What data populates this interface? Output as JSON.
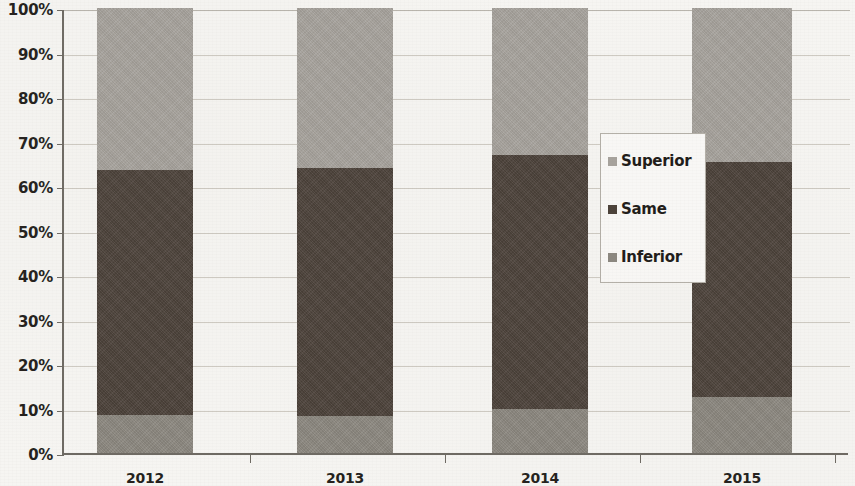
{
  "chart_data": {
    "type": "bar",
    "subtype": "stacked-100-percent",
    "title": "",
    "xlabel": "",
    "ylabel": "",
    "categories": [
      "2012",
      "2013",
      "2014",
      "2015"
    ],
    "series": [
      {
        "name": "Inferior",
        "color": "#8c8880",
        "values": [
          8.5,
          8.3,
          10.0,
          12.5
        ]
      },
      {
        "name": "Same",
        "color": "#4a4038",
        "values": [
          55.0,
          55.7,
          57.0,
          53.0
        ]
      },
      {
        "name": "Superior",
        "color": "#a8a49e",
        "values": [
          36.5,
          36.0,
          33.0,
          34.5
        ]
      }
    ],
    "stack_order_bottom_to_top": [
      "Inferior",
      "Same",
      "Superior"
    ],
    "ylim": [
      0,
      100
    ],
    "ytick_labels": [
      "0%",
      "10%",
      "20%",
      "30%",
      "40%",
      "50%",
      "60%",
      "70%",
      "80%",
      "90%",
      "100%"
    ],
    "ytick_values": [
      0,
      10,
      20,
      30,
      40,
      50,
      60,
      70,
      80,
      90,
      100
    ],
    "grid": true,
    "legend_position": "center-right",
    "legend_entries": [
      {
        "label": "Superior",
        "color": "#a8a49e"
      },
      {
        "label": "Same",
        "color": "#4a4038"
      },
      {
        "label": "Inferior",
        "color": "#8c8880"
      }
    ]
  },
  "bar_layout": {
    "bars": [
      {
        "x": 33,
        "width": 96
      },
      {
        "x": 233,
        "width": 96
      },
      {
        "x": 428,
        "width": 96
      },
      {
        "x": 628,
        "width": 100
      }
    ],
    "tick_positions": [
      186,
      381,
      576,
      771
    ]
  },
  "colors": {
    "axis": "#6e6a63",
    "gridline": "#cfcbc3",
    "text": "#231f1c",
    "plot_background": "#f7f6f3",
    "legend_background": "#fbfaf8",
    "legend_border": "#b5b1a9"
  }
}
